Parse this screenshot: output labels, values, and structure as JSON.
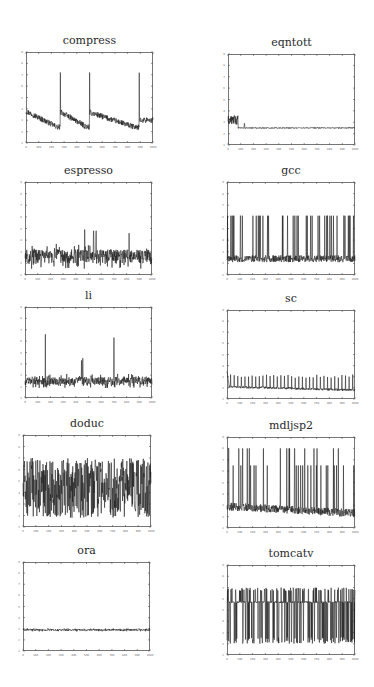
{
  "figure": {
    "background": "#ffffff",
    "line_color": "#1a1a1a",
    "axis_color": "#555555"
  },
  "chart_data": [
    {
      "id": "compress",
      "type": "line",
      "title": "compress",
      "xlim": [
        0,
        1000
      ],
      "ylim": [
        1,
        9
      ],
      "xticks": [
        0,
        100,
        200,
        300,
        400,
        500,
        600,
        700,
        800,
        900,
        1000
      ],
      "yticks": [
        1,
        2,
        3,
        4,
        5,
        6,
        7,
        8,
        9
      ],
      "box": {
        "x": 26,
        "y": 52,
        "w": 127,
        "h": 91
      },
      "title_y": 34,
      "description": "Sawtooth decay with spikes to ~7.2 at x~270, ~500, ~890; baseline decays from ~3.8 to ~2.4",
      "pattern": {
        "kind": "sawtooth",
        "resets": [
          0,
          270,
          500,
          890
        ],
        "spike": 7.2,
        "start": 3.8,
        "end": 2.4,
        "noise": 0.25
      }
    },
    {
      "id": "eqntott",
      "type": "line",
      "title": "eqntott",
      "xlim": [
        0,
        1000
      ],
      "ylim": [
        1,
        9
      ],
      "xticks": [
        0,
        100,
        200,
        300,
        400,
        500,
        600,
        700,
        800,
        900,
        1000
      ],
      "yticks": [
        1,
        2,
        3,
        4,
        5,
        6,
        7,
        8,
        9
      ],
      "box": {
        "x": 228,
        "y": 54,
        "w": 127,
        "h": 91
      },
      "title_y": 36,
      "description": "Initial burst ~3-3.6 during x<80, then flat at ~2.5",
      "pattern": {
        "kind": "burst-then-flat",
        "burst_end": 80,
        "burst_lo": 2.8,
        "burst_hi": 3.6,
        "level": 2.5,
        "noise": 0.05
      }
    },
    {
      "id": "espresso",
      "type": "line",
      "title": "espresso",
      "xlim": [
        0,
        1000
      ],
      "ylim": [
        1,
        9
      ],
      "xticks": [
        0,
        100,
        200,
        300,
        400,
        500,
        600,
        700,
        800,
        900,
        1000
      ],
      "yticks": [
        1,
        2,
        3,
        4,
        5,
        6,
        7,
        8,
        9
      ],
      "box": {
        "x": 25,
        "y": 182,
        "w": 127,
        "h": 93
      },
      "title_y": 164,
      "description": "Noisy band ~2-3.5 with occasional spikes up to ~5",
      "pattern": {
        "kind": "noise",
        "level": 2.6,
        "noise": 0.6,
        "spikes": [
          [
            470,
            4.9
          ],
          [
            540,
            4.8
          ],
          [
            560,
            4.8
          ],
          [
            820,
            4.6
          ]
        ]
      }
    },
    {
      "id": "gcc",
      "type": "line",
      "title": "gcc",
      "xlim": [
        0,
        1000
      ],
      "ylim": [
        1,
        9
      ],
      "xticks": [
        0,
        100,
        200,
        300,
        400,
        500,
        600,
        700,
        800,
        900,
        1000
      ],
      "yticks": [
        1,
        2,
        3,
        4,
        5,
        6,
        7,
        8,
        9
      ],
      "box": {
        "x": 227,
        "y": 182,
        "w": 128,
        "h": 93
      },
      "title_y": 164,
      "description": "Baseline ~2.2-2.8 with frequent spikes to ~6.1",
      "pattern": {
        "kind": "spiky",
        "level": 2.4,
        "noise": 0.3,
        "spike": 6.1,
        "spike_rate": 0.09
      }
    },
    {
      "id": "li",
      "type": "line",
      "title": "li",
      "xlim": [
        0,
        1000
      ],
      "ylim": [
        1,
        9
      ],
      "xticks": [
        0,
        100,
        200,
        300,
        400,
        500,
        600,
        700,
        800,
        900,
        1000
      ],
      "yticks": [
        1,
        2,
        3,
        4,
        5,
        6,
        7,
        8,
        9
      ],
      "box": {
        "x": 25,
        "y": 307,
        "w": 127,
        "h": 91
      },
      "title_y": 289,
      "description": "Noisy band ~2.5 with three spikes: ~6.6 at x~160, ~4.5 at x~450, ~6.3 at x~700",
      "pattern": {
        "kind": "noise",
        "level": 2.5,
        "noise": 0.35,
        "spikes": [
          [
            160,
            6.6
          ],
          [
            445,
            4.3
          ],
          [
            455,
            4.5
          ],
          [
            700,
            6.3
          ]
        ]
      }
    },
    {
      "id": "sc",
      "type": "line",
      "title": "sc",
      "xlim": [
        0,
        1000
      ],
      "ylim": [
        1,
        9
      ],
      "xticks": [
        0,
        100,
        200,
        300,
        400,
        500,
        600,
        700,
        800,
        900,
        1000
      ],
      "yticks": [
        1,
        2,
        3,
        4,
        5,
        6,
        7,
        8,
        9
      ],
      "box": {
        "x": 227,
        "y": 310,
        "w": 128,
        "h": 89
      },
      "title_y": 292,
      "description": "Initial bump ~3.5, then baseline ~2.1 with periodic spikes to ~3.2",
      "pattern": {
        "kind": "periodic",
        "level": 2.1,
        "noise": 0.1,
        "spike": 3.2,
        "period": 28,
        "initial": 3.5
      }
    },
    {
      "id": "doduc",
      "type": "line",
      "title": "doduc",
      "xlim": [
        0,
        1000
      ],
      "ylim": [
        1,
        9
      ],
      "xticks": [
        0,
        100,
        200,
        300,
        400,
        500,
        600,
        700,
        800,
        900,
        1000
      ],
      "yticks": [
        1,
        2,
        3,
        4,
        5,
        6,
        7,
        8,
        9
      ],
      "box": {
        "x": 23,
        "y": 435,
        "w": 128,
        "h": 92
      },
      "title_y": 417,
      "description": "Dense oscillation between ~1.8 and ~7",
      "pattern": {
        "kind": "dense",
        "lo": 1.8,
        "hi": 7.0
      }
    },
    {
      "id": "mdljsp2",
      "type": "line",
      "title": "mdljsp2",
      "xlim": [
        0,
        1000
      ],
      "ylim": [
        1,
        9
      ],
      "xticks": [
        0,
        100,
        200,
        300,
        400,
        500,
        600,
        700,
        800,
        900,
        1000
      ],
      "yticks": [
        1,
        2,
        3,
        4,
        5,
        6,
        7,
        8,
        9
      ],
      "box": {
        "x": 227,
        "y": 437,
        "w": 128,
        "h": 91
      },
      "title_y": 419,
      "description": "Baseline ~2.8 declining to ~2.3 with spikes to ~6.5 and ~8",
      "pattern": {
        "kind": "spiky2",
        "start": 2.9,
        "end": 2.3,
        "noise": 0.35,
        "spike_lo": 6.5,
        "spike_hi": 8.0,
        "spike_rate": 0.07
      }
    },
    {
      "id": "ora",
      "type": "line",
      "title": "ora",
      "xlim": [
        0,
        1000
      ],
      "ylim": [
        1,
        9
      ],
      "xticks": [
        0,
        100,
        200,
        300,
        400,
        500,
        600,
        700,
        800,
        900,
        1000
      ],
      "yticks": [
        1,
        2,
        3,
        4,
        5,
        6,
        7,
        8,
        9
      ],
      "box": {
        "x": 23,
        "y": 562,
        "w": 127,
        "h": 89
      },
      "title_y": 544,
      "description": "Flat at ~2.9 with small noise",
      "pattern": {
        "kind": "noise",
        "level": 2.9,
        "noise": 0.08,
        "spikes": []
      }
    },
    {
      "id": "tomcatv",
      "type": "line",
      "title": "tomcatv",
      "xlim": [
        0,
        1000
      ],
      "ylim": [
        1,
        9
      ],
      "xticks": [
        0,
        100,
        200,
        300,
        400,
        500,
        600,
        700,
        800,
        900,
        1000
      ],
      "yticks": [
        1,
        2,
        3,
        4,
        5,
        6,
        7,
        8,
        9
      ],
      "box": {
        "x": 227,
        "y": 565,
        "w": 128,
        "h": 90
      },
      "title_y": 547,
      "description": "Dense band at ~5.7 with drops to ~2 and rises to ~7",
      "pattern": {
        "kind": "square",
        "level": 5.7,
        "lo": 2.0,
        "hi": 7.0
      }
    }
  ]
}
